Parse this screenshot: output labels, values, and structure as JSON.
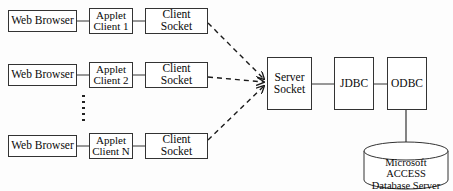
{
  "diagram": {
    "canvas": {
      "width": 453,
      "height": 191
    },
    "colors": {
      "background": "#fdfdfd",
      "stroke": "#333333",
      "node_fill": "#ffffff",
      "text": "#0a0a0a",
      "dashed_stroke": "#1a1a1a"
    },
    "clients": [
      {
        "browser": "Web Browser",
        "applet": "Applet\nClient 1",
        "socket": "Client\nSocket"
      },
      {
        "browser": "Web Browser",
        "applet": "Applet\nClient 2",
        "socket": "Client\nSocket"
      },
      {
        "browser": "Web Browser",
        "applet": "Applet\nClient N",
        "socket": "Client\nSocket"
      }
    ],
    "ellipsis": "vertical-dots",
    "server": {
      "socket": "Server\nSocket",
      "jdbc": "JDBC",
      "odbc": "ODBC"
    },
    "database": {
      "label": "Microsoft\nACCESS\nDatabase Server"
    },
    "connectors": {
      "solid": "solid-line",
      "dashed": "dashed-arrow"
    }
  }
}
